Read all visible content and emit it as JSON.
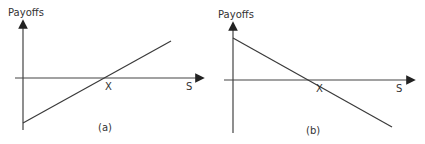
{
  "panels": [
    {
      "id": "a",
      "y_axis_label": "Payoffs",
      "x_axis_label": "S",
      "strike_label": "X",
      "caption": "(a)",
      "line": {
        "x1": 23,
        "y1": 123,
        "x2": 171,
        "y2": 41,
        "slope": "positive"
      }
    },
    {
      "id": "b",
      "y_axis_label": "Payoffs",
      "x_axis_label": "S",
      "strike_label": "X",
      "caption": "(b)",
      "line": {
        "x1": 233,
        "y1": 38,
        "x2": 392,
        "y2": 127,
        "slope": "negative"
      }
    }
  ],
  "colors": {
    "axis": "#444444",
    "line": "#3a3a3a",
    "text": "#333333"
  }
}
